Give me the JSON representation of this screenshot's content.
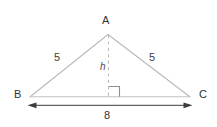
{
  "figure": {
    "type": "isosceles-triangle-with-altitude",
    "background_color": "#ffffff",
    "stroke_color": "#b9b9b9",
    "dash_color": "#bdbdbd",
    "arrow_color": "#3c3c3c",
    "text_color": "#333333"
  },
  "vertices": {
    "apex_label": "A",
    "left_label": "B",
    "right_label": "C"
  },
  "measurements": {
    "left_side": "5",
    "right_side": "5",
    "height": "h",
    "base": "8"
  },
  "annotations": {
    "right_angle_marker": "right-angle-square",
    "altitude_style": "dashed",
    "base_dimension_style": "double-headed-arrow"
  },
  "geometry": {
    "apex": [
      108,
      34
    ],
    "left_vertex": [
      30,
      97
    ],
    "right_vertex": [
      190,
      97
    ],
    "foot_of_altitude": [
      108,
      97
    ],
    "dimension_line_y": 105,
    "dimension_start_x": 28,
    "dimension_end_x": 192
  }
}
